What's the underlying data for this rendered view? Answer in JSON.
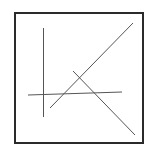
{
  "diagram": {
    "background": "#ffffff",
    "frame": {
      "x": 15,
      "y": 13,
      "width": 128,
      "height": 130,
      "stroke": "#2a2a2a",
      "stroke_width": 2
    },
    "lines": [
      {
        "name": "vertical-line",
        "x1": 43.5,
        "y1": 28,
        "x2": 43.5,
        "y2": 117,
        "stroke": "#555555",
        "stroke_width": 1
      },
      {
        "name": "horizontal-line",
        "x1": 28,
        "y1": 95,
        "x2": 122,
        "y2": 92,
        "stroke": "#555555",
        "stroke_width": 1
      },
      {
        "name": "rising-diagonal-line",
        "x1": 50,
        "y1": 108,
        "x2": 133,
        "y2": 23,
        "stroke": "#555555",
        "stroke_width": 1
      },
      {
        "name": "descending-diagonal-line",
        "x1": 73,
        "y1": 71,
        "x2": 135,
        "y2": 135,
        "stroke": "#555555",
        "stroke_width": 1
      }
    ]
  }
}
